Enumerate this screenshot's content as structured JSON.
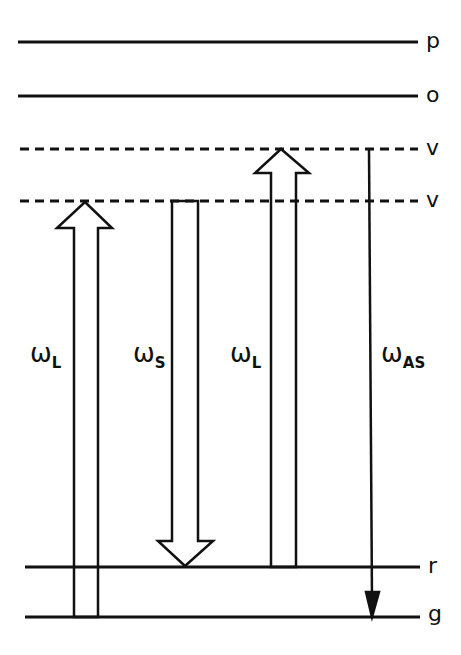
{
  "diagram": {
    "type": "energy-level diagram (CARS / coherent anti-Stokes Raman scattering)",
    "colors": {
      "line": "#111111",
      "background": "#ffffff"
    },
    "levels": [
      {
        "label": "p",
        "style": "solid"
      },
      {
        "label": "o",
        "style": "solid"
      },
      {
        "label": "v",
        "style": "dashed"
      },
      {
        "label": "v",
        "style": "dashed"
      },
      {
        "label": "r",
        "style": "solid"
      },
      {
        "label": "g",
        "style": "solid"
      }
    ],
    "transitions": [
      {
        "symbol": "ω",
        "subscript": "L",
        "direction": "up",
        "from": "g",
        "to": "v (lower)",
        "arrow": "hollow"
      },
      {
        "symbol": "ω",
        "subscript": "S",
        "direction": "down",
        "from": "v (lower)",
        "to": "r",
        "arrow": "hollow"
      },
      {
        "symbol": "ω",
        "subscript": "L",
        "direction": "up",
        "from": "r",
        "to": "v (upper)",
        "arrow": "hollow"
      },
      {
        "symbol": "ω",
        "subscript": "AS",
        "direction": "down",
        "from": "v (upper)",
        "to": "g",
        "arrow": "thin"
      }
    ]
  }
}
